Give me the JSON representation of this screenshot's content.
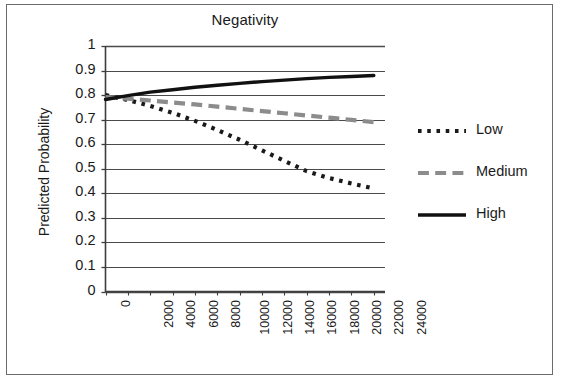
{
  "figure": {
    "background_color": "#ffffff",
    "border_color": "#6b6b6b"
  },
  "chart_data": {
    "type": "line",
    "title": "Negativity",
    "xlabel": "",
    "ylabel": "Predicted Probability",
    "xlim": [
      0,
      25000
    ],
    "ylim": [
      0,
      1
    ],
    "grid": true,
    "grid_axis": "y",
    "legend_position": "right",
    "categories": [
      0,
      2000,
      4000,
      6000,
      8000,
      10000,
      12000,
      14000,
      16000,
      18000,
      20000,
      22000,
      24000
    ],
    "x_tick_labels": [
      "0",
      "2000",
      "4000",
      "6000",
      "8000",
      "10000",
      "12000",
      "14000",
      "16000",
      "18000",
      "20000",
      "22000",
      "24000"
    ],
    "y_tick_labels": [
      "0",
      "0.1",
      "0.2",
      "0.3",
      "0.4",
      "0.5",
      "0.6",
      "0.7",
      "0.8",
      "0.9",
      "1"
    ],
    "y_ticks": [
      0,
      0.1,
      0.2,
      0.3,
      0.4,
      0.5,
      0.6,
      0.7,
      0.8,
      0.9,
      1
    ],
    "series": [
      {
        "name": "Low",
        "color": "#1a1a1a",
        "style": "dotted",
        "x": [
          0,
          2000,
          4000,
          6000,
          8000,
          10000,
          12000,
          14000,
          16000,
          18000,
          20000,
          22000,
          24000
        ],
        "values": [
          0.8,
          0.78,
          0.756,
          0.728,
          0.695,
          0.658,
          0.618,
          0.575,
          0.532,
          0.49,
          0.462,
          0.44,
          0.42
        ]
      },
      {
        "name": "Medium",
        "color": "#8c8c8c",
        "style": "dashed",
        "x": [
          0,
          2000,
          4000,
          6000,
          8000,
          10000,
          12000,
          14000,
          16000,
          18000,
          20000,
          22000,
          24000
        ],
        "values": [
          0.792,
          0.785,
          0.778,
          0.77,
          0.762,
          0.753,
          0.744,
          0.735,
          0.726,
          0.717,
          0.708,
          0.699,
          0.69
        ]
      },
      {
        "name": "High",
        "color": "#111111",
        "style": "solid",
        "x": [
          0,
          2000,
          4000,
          6000,
          8000,
          10000,
          12000,
          14000,
          16000,
          18000,
          20000,
          22000,
          24000
        ],
        "values": [
          0.782,
          0.798,
          0.812,
          0.822,
          0.832,
          0.84,
          0.848,
          0.855,
          0.861,
          0.867,
          0.872,
          0.876,
          0.88
        ]
      }
    ]
  },
  "legend": {
    "items": [
      {
        "label": "Low",
        "color": "#1a1a1a",
        "style": "dotted"
      },
      {
        "label": "Medium",
        "color": "#8c8c8c",
        "style": "dashed"
      },
      {
        "label": "High",
        "color": "#111111",
        "style": "solid"
      }
    ]
  }
}
